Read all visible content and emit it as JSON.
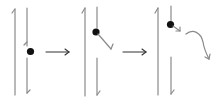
{
  "diagram": {
    "title": "",
    "panels": [
      {
        "id": "stage-1",
        "description": "particle between two antiparallel lines, at midpoint of right line gap"
      },
      {
        "id": "stage-2",
        "description": "particle near top of right line, deflected diagonally"
      },
      {
        "id": "stage-3",
        "description": "particle at top of right line, emitted with curved trajectory"
      }
    ],
    "transitions": [
      "arrow",
      "arrow"
    ],
    "colors": {
      "line": "#8a8a8a",
      "arrow": "#333333",
      "particle": "#111111",
      "background": "#ffffff"
    }
  }
}
